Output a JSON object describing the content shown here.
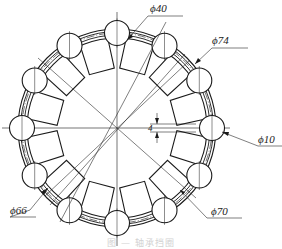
{
  "figure": {
    "type": "mechanical-drawing",
    "center": [
      117,
      128
    ],
    "ball_count": 12,
    "slot_count": 12,
    "caption": "图 — 轴承挡圈"
  },
  "dimensions": [
    {
      "id": "d40",
      "label": "ϕ40",
      "x": 148,
      "y": 3
    },
    {
      "id": "d74",
      "label": "ϕ74",
      "x": 212,
      "y": 34
    },
    {
      "id": "d10",
      "label": "ϕ10",
      "x": 259,
      "y": 134
    },
    {
      "id": "d70",
      "label": "ϕ70",
      "x": 211,
      "y": 206
    },
    {
      "id": "d66",
      "label": "ϕ66",
      "x": 10,
      "y": 205
    },
    {
      "id": "slot_width",
      "label": "4",
      "x": 172,
      "y": 125
    }
  ],
  "colors": {
    "line": "#1a1a1a",
    "thin": "#2a2a2a",
    "background": "#ffffff"
  }
}
